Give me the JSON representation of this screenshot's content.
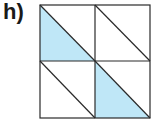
{
  "label": "h)",
  "figure": {
    "type": "2x2 grid of squares, each split by a diagonal from top-left to bottom-right",
    "rows": 2,
    "cols": 2,
    "shaded_triangles": [
      {
        "row": 0,
        "col": 0,
        "half": "lower-left"
      },
      {
        "row": 1,
        "col": 1,
        "half": "lower-left"
      }
    ],
    "colors": {
      "fill": "#bfe7f7",
      "stroke": "#2a2a2a",
      "background": "#ffffff"
    }
  }
}
